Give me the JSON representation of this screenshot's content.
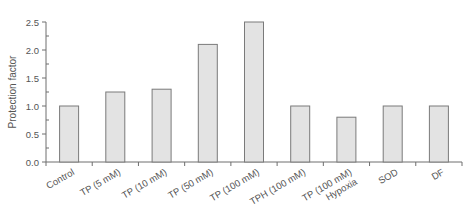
{
  "chart_data": {
    "type": "bar",
    "title": "",
    "xlabel": "",
    "ylabel": "Protection factor",
    "ylim": [
      0,
      2.5
    ],
    "yticks": [
      0.0,
      0.5,
      1.0,
      1.5,
      2.0,
      2.5
    ],
    "ytick_labels": [
      "0.0",
      "0.5",
      "1.0",
      "1.5",
      "2.0",
      "2.5"
    ],
    "minor_ytick_step": 0.25,
    "grid": false,
    "legend": null,
    "categories": [
      [
        "Control"
      ],
      [
        "TP (5 mM)"
      ],
      [
        "TP (10 mM)"
      ],
      [
        "TP (50 mM)"
      ],
      [
        "TP (100 mM)"
      ],
      [
        "TPH (100 mM)"
      ],
      [
        "TP (100 mM)",
        "Hypoxia"
      ],
      [
        "SOD"
      ],
      [
        "DF"
      ]
    ],
    "values": [
      1.0,
      1.25,
      1.3,
      2.1,
      2.5,
      1.0,
      0.8,
      1.0,
      1.0
    ],
    "colors": {
      "bar_fill": "#e3e3e3",
      "bar_stroke": "#7a7a7a",
      "axis": "#6e6e6e",
      "text": "#555555"
    }
  }
}
